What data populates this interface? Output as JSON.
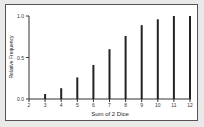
{
  "chart_data": {
    "type": "bar",
    "title": "",
    "xlabel": "Sum of 2 Dice",
    "ylabel": "Relative Frequency",
    "categories": [
      "2",
      "3",
      "4",
      "5",
      "6",
      "7",
      "8",
      "9",
      "10",
      "11",
      "12"
    ],
    "values": [
      0.0,
      0.06,
      0.13,
      0.26,
      0.41,
      0.6,
      0.76,
      0.89,
      0.96,
      1.0,
      1.0
    ],
    "ylim": [
      0,
      1.0
    ],
    "yticks": [
      "0.0",
      "0.5",
      "1.0"
    ],
    "grid": false,
    "legend": null
  },
  "colors": {
    "bar": "#222222",
    "axis": "#333333",
    "background": "#ffffff"
  }
}
